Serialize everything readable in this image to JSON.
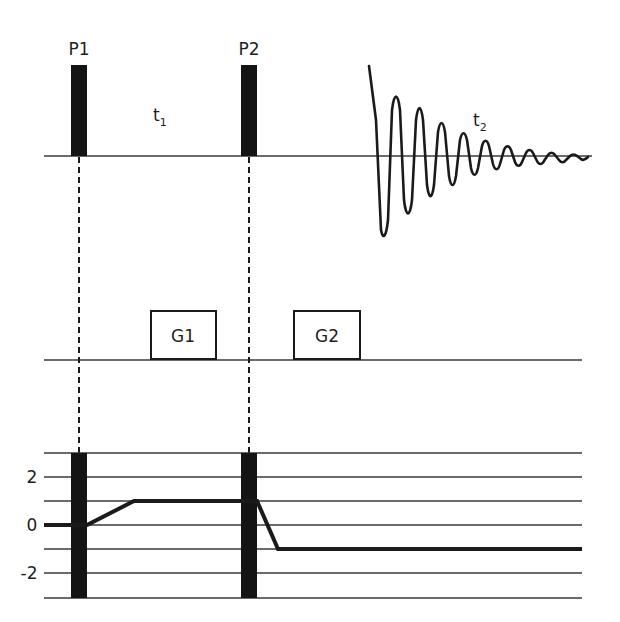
{
  "diagram": {
    "type": "pulse-sequence",
    "colors": {
      "ink": "#141414",
      "line": "#3a3a3a",
      "background": "#ffffff"
    },
    "rf_channel": {
      "pulses": [
        {
          "label": "P1"
        },
        {
          "label": "P2"
        }
      ],
      "delays": [
        {
          "label": "t",
          "subscript": "1"
        },
        {
          "label": "t",
          "subscript": "2"
        }
      ],
      "signal": "decaying-oscillation (FID)"
    },
    "gradient_channel": {
      "gradients": [
        {
          "label": "G1"
        },
        {
          "label": "G2"
        }
      ]
    },
    "coherence_pathway": {
      "y_ticks": [
        "2",
        "0",
        "-2"
      ],
      "levels": [
        -3,
        -2,
        -1,
        0,
        1,
        2,
        3
      ],
      "path": [
        {
          "segment": "start",
          "level": 0
        },
        {
          "segment": "after P1",
          "level": 1
        },
        {
          "segment": "after P2",
          "level": -1
        }
      ]
    }
  }
}
